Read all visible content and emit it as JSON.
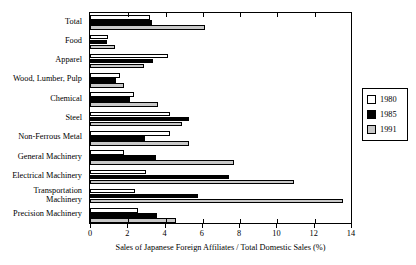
{
  "chart_data": {
    "type": "bar",
    "orientation": "horizontal",
    "title": "",
    "xlabel": "Sales of Japanese Foreign Affiliates / Total Domestic Sales (%)",
    "ylabel": "",
    "xlim": [
      0,
      14
    ],
    "xticks": [
      0,
      2,
      4,
      6,
      8,
      10,
      12,
      14
    ],
    "xtick_labels": [
      "0",
      "2",
      "4",
      "6",
      "8",
      "10",
      "12",
      "14"
    ],
    "grid": false,
    "legend_position": "right",
    "categories": [
      "Total",
      "Food",
      "Apparel",
      "Wood, Lumber, Pulp",
      "Chemical",
      "Steel",
      "Non-Ferrous Metal",
      "General Machinery",
      "Electrical Machinery",
      "Transportation Machinery",
      "Precision Machinery"
    ],
    "series": [
      {
        "name": "1980",
        "color": "#ffffff",
        "values": [
          3.2,
          0.95,
          4.2,
          1.6,
          2.35,
          4.3,
          4.3,
          1.8,
          3.0,
          2.4,
          2.55
        ]
      },
      {
        "name": "1985",
        "color": "#000000",
        "values": [
          3.3,
          0.9,
          3.4,
          1.4,
          2.15,
          5.3,
          2.95,
          3.55,
          7.45,
          5.8,
          3.6
        ]
      },
      {
        "name": "1991",
        "color": "#c8c8c8",
        "values": [
          6.15,
          1.35,
          2.9,
          1.85,
          3.65,
          4.95,
          5.3,
          7.7,
          10.95,
          13.55,
          4.6
        ]
      }
    ]
  },
  "legend": {
    "entries": [
      {
        "label": "1980"
      },
      {
        "label": "1985"
      },
      {
        "label": "1991"
      }
    ]
  }
}
